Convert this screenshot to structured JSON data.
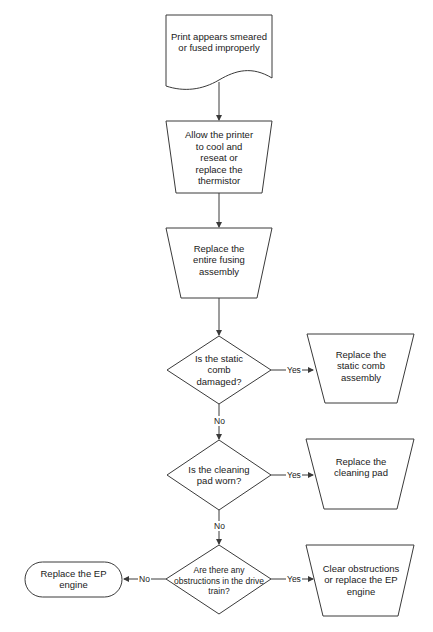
{
  "diagram": {
    "type": "flowchart",
    "nodes": {
      "start": {
        "shape": "document",
        "text": "Print appears smeared or fused improperly"
      },
      "step1": {
        "shape": "manual-operation",
        "text": "Allow the printer to cool and reseat or replace the thermistor"
      },
      "step2": {
        "shape": "manual-operation",
        "text": "Replace the entire fusing assembly"
      },
      "decision1": {
        "shape": "decision",
        "text": "Is the static comb damaged?"
      },
      "action1": {
        "shape": "manual-operation",
        "text": "Replace the static comb assembly"
      },
      "decision2": {
        "shape": "decision",
        "text": "Is the cleaning pad worn?"
      },
      "action2": {
        "shape": "manual-operation",
        "text": "Replace the cleaning pad"
      },
      "decision3": {
        "shape": "decision",
        "text": "Are there any obstructions in the drive train?"
      },
      "action3": {
        "shape": "manual-operation",
        "text": "Clear obstructions or replace the EP engine"
      },
      "terminal": {
        "shape": "terminator",
        "text": "Replace the EP engine"
      }
    },
    "edges": {
      "d1_yes": "Yes",
      "d1_no": "No",
      "d2_yes": "Yes",
      "d2_no": "No",
      "d3_yes": "Yes",
      "d3_no": "No"
    },
    "colors": {
      "stroke": "#3a3a3a",
      "fill": "#ffffff",
      "text": "#1a1a1a"
    }
  }
}
